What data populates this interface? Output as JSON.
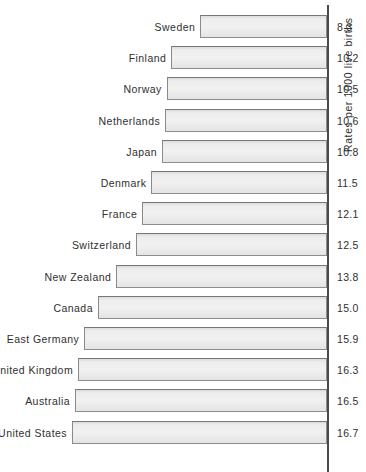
{
  "chart_data": {
    "type": "bar",
    "orientation": "horizontal",
    "title": "",
    "subtitle": "",
    "xlabel": "",
    "ylabel": "Rates per 1000 live births",
    "value_axis_title": "Rates per 1000 live births",
    "grid": false,
    "legend": null,
    "legend_position": "none",
    "xlim": [
      0,
      16.7
    ],
    "bar_anchor": "right",
    "bar_direction": "leftward",
    "categories": [
      "Sweden",
      "Finland",
      "Norway",
      "Netherlands",
      "Japan",
      "Denmark",
      "France",
      "Switzerland",
      "New Zealand",
      "Canada",
      "East Germany",
      "United Kingdom",
      "Australia",
      "United States"
    ],
    "values": [
      8.3,
      10.2,
      10.5,
      10.6,
      10.8,
      11.5,
      12.1,
      12.5,
      13.8,
      15.0,
      15.9,
      16.3,
      16.5,
      16.7
    ],
    "value_labels": [
      "8.3",
      "10.2",
      "10.5",
      "10.6",
      "10.8",
      "11.5",
      "12.1",
      "12.5",
      "13.8",
      "15.0",
      "15.9",
      "16.3",
      "16.5",
      "16.7"
    ],
    "rows": [
      {
        "category": "Sweden",
        "value": 8.3,
        "value_label": "8.3"
      },
      {
        "category": "Finland",
        "value": 10.2,
        "value_label": "10.2"
      },
      {
        "category": "Norway",
        "value": 10.5,
        "value_label": "10.5"
      },
      {
        "category": "Netherlands",
        "value": 10.6,
        "value_label": "10.6"
      },
      {
        "category": "Japan",
        "value": 10.8,
        "value_label": "10.8"
      },
      {
        "category": "Denmark",
        "value": 11.5,
        "value_label": "11.5"
      },
      {
        "category": "France",
        "value": 12.1,
        "value_label": "12.1"
      },
      {
        "category": "Switzerland",
        "value": 12.5,
        "value_label": "12.5"
      },
      {
        "category": "New Zealand",
        "value": 13.8,
        "value_label": "13.8"
      },
      {
        "category": "Canada",
        "value": 15.0,
        "value_label": "15.0"
      },
      {
        "category": "East Germany",
        "value": 15.9,
        "value_label": "15.9"
      },
      {
        "category": "United Kingdom",
        "value": 16.3,
        "value_label": "16.3"
      },
      {
        "category": "Australia",
        "value": 16.5,
        "value_label": "16.5"
      },
      {
        "category": "United States",
        "value": 16.7,
        "value_label": "16.7"
      }
    ]
  },
  "style": {
    "bar_fill": "#ededed",
    "bar_border": "#8d8d8d",
    "axis_color": "#4a4a4a",
    "text_color": "#2f2f2f",
    "background": "#ffffff"
  },
  "geometry": {
    "axis_x": 327,
    "pixels_per_unit": 15.27,
    "first_row_top": 15,
    "row_pitch": 31.2,
    "bar_height": 23,
    "label_gap": 5
  }
}
